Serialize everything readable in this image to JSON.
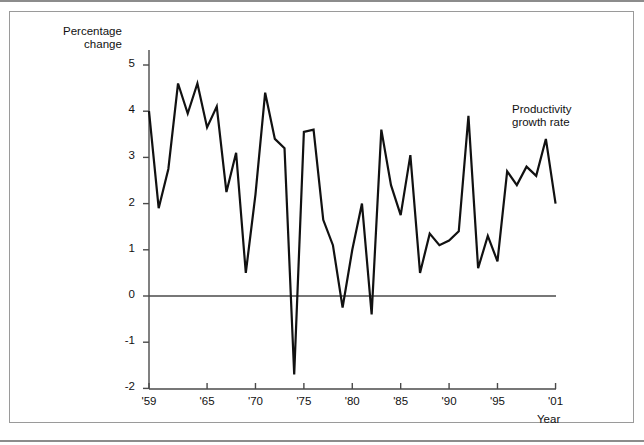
{
  "figure": {
    "frame_border_color": "#9a9a9a",
    "rule_color": "#8c8c8c",
    "background": "#ffffff"
  },
  "annotations": {
    "series_label_line1": "Productivity",
    "series_label_line2": "growth rate"
  },
  "axes": {
    "y_title_line1": "Percentage",
    "y_title_line2": "change",
    "x_title": "Year",
    "y_tick_labels": [
      "5",
      "4",
      "3",
      "2",
      "1",
      "0",
      "-1",
      "-2"
    ],
    "x_tick_labels": [
      "'59",
      "'65",
      "'70",
      "'75",
      "'80",
      "'85",
      "'90",
      "'95",
      "'01"
    ]
  },
  "chart_data": {
    "type": "line",
    "title": "",
    "subtitle": "",
    "xlabel": "Year",
    "ylabel": "Percentage change",
    "xlim": [
      1959,
      2001
    ],
    "ylim": [
      -2,
      5.4
    ],
    "grid": false,
    "legend": "none",
    "zero_line": true,
    "line_color": "#111111",
    "line_width": 2.2,
    "x_tick_values": [
      1959,
      1965,
      1970,
      1975,
      1980,
      1985,
      1990,
      1995,
      2001
    ],
    "y_tick_values": [
      5,
      4,
      3,
      2,
      1,
      0,
      -1,
      -2
    ],
    "series": [
      {
        "name": "Productivity growth rate",
        "x": [
          1959,
          1960,
          1961,
          1962,
          1963,
          1964,
          1965,
          1966,
          1967,
          1968,
          1969,
          1970,
          1971,
          1972,
          1973,
          1974,
          1975,
          1976,
          1977,
          1978,
          1979,
          1980,
          1981,
          1982,
          1983,
          1984,
          1985,
          1986,
          1987,
          1988,
          1989,
          1990,
          1991,
          1992,
          1993,
          1994,
          1995,
          1996,
          1997,
          1998,
          1999,
          2000,
          2001
        ],
        "values": [
          4.0,
          1.9,
          2.75,
          4.6,
          3.95,
          4.6,
          3.65,
          4.1,
          2.25,
          3.1,
          0.5,
          2.2,
          4.4,
          3.4,
          3.2,
          -1.7,
          3.55,
          3.6,
          1.65,
          1.1,
          -0.25,
          1.0,
          2.0,
          -0.4,
          3.6,
          2.4,
          1.75,
          3.05,
          0.5,
          1.35,
          1.1,
          1.2,
          1.4,
          3.9,
          0.6,
          1.3,
          0.75,
          2.7,
          2.4,
          2.8,
          2.6,
          3.4,
          2.0
        ]
      }
    ]
  }
}
